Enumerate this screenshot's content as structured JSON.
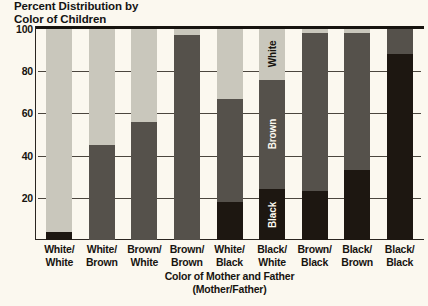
{
  "chart_data": {
    "type": "bar",
    "stacked": true,
    "title": "Percent Distribution by Color of Children",
    "title_lines": [
      "Percent Distribution by",
      "Color of Children"
    ],
    "xlabel": "Color of Mother and Father",
    "xlabel_sub": "(Mother/Father)",
    "ylabel": "",
    "ylim": [
      0,
      100
    ],
    "yticks": [
      20,
      40,
      60,
      80,
      100
    ],
    "ytick_labels": [
      "20",
      "40",
      "60",
      "80",
      "100"
    ],
    "grid": true,
    "legend_position": "in-bar",
    "categories": [
      "White/White",
      "White/Brown",
      "Brown/White",
      "Brown/Brown",
      "White/Black",
      "Black/White",
      "Brown/Black",
      "Black/Brown",
      "Black/Black"
    ],
    "category_lines": [
      [
        "White/",
        "White"
      ],
      [
        "White/",
        "Brown"
      ],
      [
        "Brown/",
        "White"
      ],
      [
        "Brown/",
        "Brown"
      ],
      [
        "White/",
        "Black"
      ],
      [
        "Black/",
        "White"
      ],
      [
        "Brown/",
        "Black"
      ],
      [
        "Black/",
        "Brown"
      ],
      [
        "Black/",
        "Black"
      ]
    ],
    "series": [
      {
        "name": "White",
        "color": "#c9c7bc",
        "values": [
          96,
          55,
          44,
          3,
          33,
          24,
          2,
          2,
          0
        ]
      },
      {
        "name": "Brown",
        "color": "#55514b",
        "values": [
          0,
          45,
          56,
          97,
          49,
          52,
          75,
          65,
          12
        ]
      },
      {
        "name": "Black",
        "color": "#1d1711",
        "values": [
          4,
          0,
          0,
          0,
          18,
          24,
          23,
          33,
          88
        ]
      }
    ],
    "annotations": [
      {
        "text": "White",
        "category": "Black/White",
        "segment": "White",
        "orientation": "vertical"
      },
      {
        "text": "Brown",
        "category": "Black/White",
        "segment": "Brown",
        "orientation": "vertical"
      },
      {
        "text": "Black",
        "category": "Black/White",
        "segment": "Black",
        "orientation": "vertical"
      }
    ],
    "colors": {
      "white_segment": "#c9c7bc",
      "brown_segment": "#55514b",
      "black_segment": "#1d1711",
      "background": "#fbf8ef",
      "axis": "#17140f",
      "gridline": "#4b463e"
    }
  }
}
